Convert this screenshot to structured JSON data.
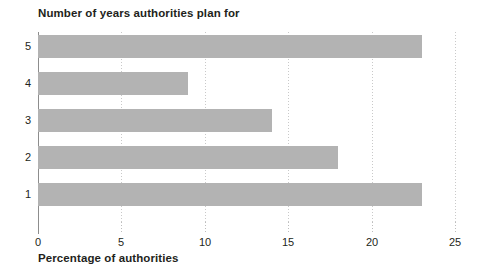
{
  "chart_data": {
    "type": "bar",
    "orientation": "horizontal",
    "title": "Number of years authorities plan for",
    "subtitle": "",
    "xlabel": "Percentage of authorities",
    "ylabel": "",
    "categories": [
      "5",
      "4",
      "3",
      "2",
      "1"
    ],
    "values": [
      23,
      9,
      14,
      18,
      23
    ],
    "series": [
      {
        "name": "Percentage of authorities",
        "values": [
          23,
          9,
          14,
          18,
          23
        ]
      }
    ],
    "xlim": [
      0,
      25
    ],
    "x_ticks": [
      0,
      5,
      10,
      15,
      20,
      25
    ],
    "x_tick_labels": [
      "0",
      "5",
      "10",
      "15",
      "20",
      "25"
    ],
    "y_tick_labels": [
      "5",
      "4",
      "3",
      "2",
      "1"
    ],
    "grid": "vertical-dotted",
    "legend": "none",
    "bar_color": "#b3b3b3",
    "axis_color": "#8d8d8d",
    "gridline_color": "#c9c9c9",
    "text_color": "#231f20",
    "background": "#ffffff",
    "annotations": []
  }
}
